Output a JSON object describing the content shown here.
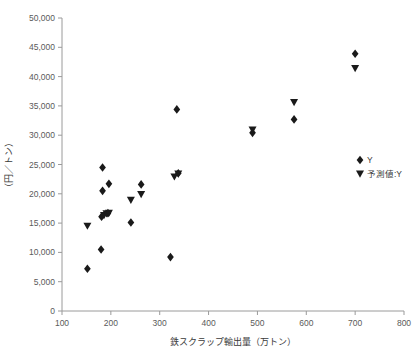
{
  "chart_data": {
    "type": "scatter",
    "title": "",
    "xlabel": "鉄スクラップ輸出量（万トン）",
    "ylabel": "（円／トン）",
    "xlim": [
      100,
      800
    ],
    "ylim": [
      0,
      50000
    ],
    "xticks": [
      100,
      200,
      300,
      400,
      500,
      600,
      700,
      800
    ],
    "xtick_labels": [
      "100",
      "200",
      "300",
      "400",
      "500",
      "600",
      "700",
      "800"
    ],
    "yticks": [
      0,
      5000,
      10000,
      15000,
      20000,
      25000,
      30000,
      35000,
      40000,
      45000,
      50000
    ],
    "ytick_labels": [
      "0",
      "5,000",
      "10,000",
      "15,000",
      "20,000",
      "25,000",
      "30,000",
      "35,000",
      "40,000",
      "45,000",
      "50,000"
    ],
    "grid": false,
    "legend_position": "right",
    "marker_color": "#1a1a1a",
    "series": [
      {
        "name": "Y",
        "marker": "diamond",
        "points": [
          [
            152,
            7200
          ],
          [
            180,
            10500
          ],
          [
            181,
            16100
          ],
          [
            183,
            20500
          ],
          [
            183,
            24500
          ],
          [
            194,
            16700
          ],
          [
            196,
            21700
          ],
          [
            241,
            15100
          ],
          [
            262,
            21600
          ],
          [
            322,
            9200
          ],
          [
            335,
            34400
          ],
          [
            338,
            23500
          ],
          [
            490,
            30400
          ],
          [
            575,
            32700
          ],
          [
            700,
            43900
          ]
        ]
      },
      {
        "name": "予測値:Y",
        "marker": "triangle-down",
        "points": [
          [
            152,
            14500
          ],
          [
            186,
            16300
          ],
          [
            191,
            16600
          ],
          [
            196,
            16700
          ],
          [
            241,
            18900
          ],
          [
            262,
            19900
          ],
          [
            330,
            22900
          ],
          [
            338,
            23400
          ],
          [
            490,
            30900
          ],
          [
            575,
            35600
          ],
          [
            700,
            41400
          ]
        ]
      }
    ],
    "legend": [
      {
        "label": "Y",
        "marker": "diamond"
      },
      {
        "label": "予測値:Y",
        "marker": "triangle-down"
      }
    ]
  }
}
